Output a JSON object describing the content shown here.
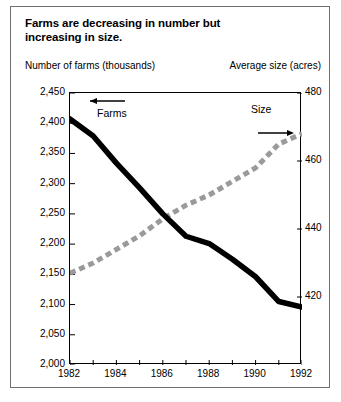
{
  "figure": {
    "title_line1": "Farms are decreasing in number but",
    "title_line2": "increasing in size.",
    "left_axis_caption": "Number of farms (thousands)",
    "right_axis_caption": "Average size (acres)"
  },
  "chart_data": {
    "type": "line",
    "title": "Farms are decreasing in number but increasing in size.",
    "xlabel": "",
    "ylabel": "Number of farms (thousands)",
    "y2label": "Average size (acres)",
    "x": [
      1982,
      1983,
      1984,
      1985,
      1986,
      1987,
      1988,
      1989,
      1990,
      1991,
      1992
    ],
    "xlim": [
      1982,
      1992
    ],
    "xticks": [
      1982,
      1983,
      1984,
      1985,
      1986,
      1987,
      1988,
      1989,
      1990,
      1991,
      1992
    ],
    "xticklabels": [
      "1982",
      "",
      "1984",
      "",
      "1986",
      "",
      "1988",
      "",
      "1990",
      "",
      "1992"
    ],
    "ylim": [
      2000,
      2450
    ],
    "yticks": [
      2000,
      2050,
      2100,
      2150,
      2200,
      2250,
      2300,
      2350,
      2400,
      2450
    ],
    "yticklabels": [
      "2,000",
      "2,050",
      "2,100",
      "2,150",
      "2,200",
      "2,250",
      "2,300",
      "2,350",
      "2,400",
      "2,450"
    ],
    "y2lim": [
      400,
      480
    ],
    "y2ticks": [
      420,
      440,
      460,
      480
    ],
    "y2ticklabels": [
      "420",
      "440",
      "460",
      "480"
    ],
    "grid": false,
    "legend": "inline-annotations",
    "series": [
      {
        "name": "Farms",
        "axis": "left",
        "style": "solid-thick-black",
        "color": "#000000",
        "values": [
          2407,
          2379,
          2334,
          2293,
          2250,
          2213,
          2201,
          2175,
          2146,
          2105,
          2096
        ]
      },
      {
        "name": "Size",
        "axis": "right",
        "style": "dashed-thick-gray",
        "color": "#9a9a9a",
        "values": [
          427,
          430,
          434,
          438,
          443,
          447,
          450,
          454,
          458,
          465,
          468
        ]
      }
    ],
    "annotations": [
      {
        "text": "Farms",
        "arrow": "left",
        "series": "Farms"
      },
      {
        "text": "Size",
        "arrow": "right",
        "series": "Size"
      }
    ]
  },
  "yticks_left": [
    {
      "label": "2,450",
      "value": 2450
    },
    {
      "label": "2,400",
      "value": 2400
    },
    {
      "label": "2,350",
      "value": 2350
    },
    {
      "label": "2,300",
      "value": 2300
    },
    {
      "label": "2,250",
      "value": 2250
    },
    {
      "label": "2,200",
      "value": 2200
    },
    {
      "label": "2,150",
      "value": 2150
    },
    {
      "label": "2,100",
      "value": 2100
    },
    {
      "label": "2,050",
      "value": 2050
    },
    {
      "label": "2,000",
      "value": 2000
    }
  ],
  "yticks_right": [
    {
      "label": "480",
      "value": 480
    },
    {
      "label": "460",
      "value": 460
    },
    {
      "label": "440",
      "value": 440
    },
    {
      "label": "420",
      "value": 420
    }
  ],
  "xticks": [
    {
      "label": "1982",
      "value": 1982
    },
    {
      "label": "1984",
      "value": 1984
    },
    {
      "label": "1986",
      "value": 1986
    },
    {
      "label": "1988",
      "value": 1988
    },
    {
      "label": "1990",
      "value": 1990
    },
    {
      "label": "1992",
      "value": 1992
    }
  ],
  "labels": {
    "farms": "Farms",
    "size": "Size"
  },
  "colors": {
    "farms_line": "#000000",
    "size_line": "#9a9a9a",
    "frame": "#000000",
    "outer_border": "#6f6f6f"
  }
}
